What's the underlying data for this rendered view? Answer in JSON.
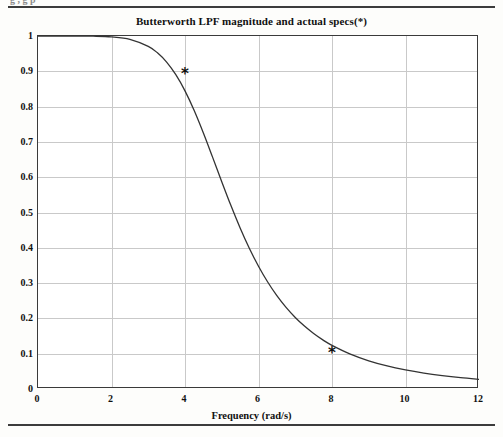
{
  "page": {
    "running_head": "g                 ,                                                                                  g      p"
  },
  "figure": {
    "title": "Butterworth LPF magnitude and actual specs(*)"
  },
  "chart_data": {
    "type": "line",
    "title": "Butterworth LPF magnitude and actual specs(*)",
    "xlabel": "Frequency  (rad/s)",
    "ylabel": "",
    "xlim": [
      0,
      12
    ],
    "ylim": [
      0,
      1
    ],
    "xticks": [
      "0",
      "2",
      "4",
      "6",
      "8",
      "10",
      "12"
    ],
    "yticks": [
      "0",
      "0.1",
      "0.2",
      "0.3",
      "0.4",
      "0.5",
      "0.6",
      "0.7",
      "0.8",
      "0.9",
      "1"
    ],
    "grid": true,
    "legend": "none",
    "series": [
      {
        "name": "Butterworth LPF magnitude",
        "type": "line",
        "color": "#333333",
        "x": [
          0,
          0.5,
          1,
          1.5,
          2,
          2.5,
          3,
          3.25,
          3.5,
          3.75,
          4,
          4.25,
          4.5,
          4.75,
          5,
          5.25,
          5.5,
          5.75,
          6,
          6.25,
          6.5,
          6.75,
          7,
          7.25,
          7.5,
          7.75,
          8,
          8.5,
          9,
          9.5,
          10,
          10.5,
          11,
          11.5,
          12
        ],
        "y": [
          1.0,
          1.0,
          0.9999,
          0.9995,
          0.9975,
          0.9907,
          0.9706,
          0.9523,
          0.9261,
          0.8904,
          0.8445,
          0.7888,
          0.7252,
          0.6569,
          0.5873,
          0.5196,
          0.4563,
          0.3989,
          0.3478,
          0.3031,
          0.2645,
          0.2312,
          0.2027,
          0.1782,
          0.1572,
          0.1392,
          0.1237,
          0.0989,
          0.08,
          0.0655,
          0.0542,
          0.0452,
          0.038,
          0.0322,
          0.0275
        ]
      },
      {
        "name": "actual specs",
        "type": "scatter",
        "marker": "*",
        "color": "#111111",
        "x": [
          4,
          8
        ],
        "y": [
          0.89,
          0.1
        ]
      }
    ]
  }
}
